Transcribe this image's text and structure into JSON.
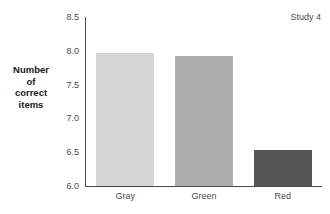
{
  "chart_data": {
    "type": "bar",
    "title": "",
    "subtitle": "",
    "xlabel": "",
    "ylabel": "Number of correct items",
    "ylabel_lines": [
      "Number",
      "of",
      "correct",
      "items"
    ],
    "categories": [
      "Gray",
      "Green",
      "Red"
    ],
    "values": [
      7.97,
      7.92,
      6.53
    ],
    "series": [
      {
        "name": "Number of correct items",
        "values": [
          7.97,
          7.92,
          6.53
        ]
      }
    ],
    "bar_colors": [
      "#d5d5d5",
      "#adadad",
      "#555555"
    ],
    "ylim": [
      6.0,
      8.5
    ],
    "yticks": [
      6.0,
      6.5,
      7.0,
      7.5,
      8.0,
      8.5
    ],
    "ytick_labels": [
      "6.0",
      "6.5",
      "7.0",
      "7.5",
      "8.0",
      "8.5"
    ],
    "grid": false,
    "legend": false,
    "legend_position": "none",
    "annotations": [
      {
        "text": "Study 4",
        "position": "top-right"
      }
    ]
  },
  "axis": {
    "line_color": "#4a4a4a"
  }
}
